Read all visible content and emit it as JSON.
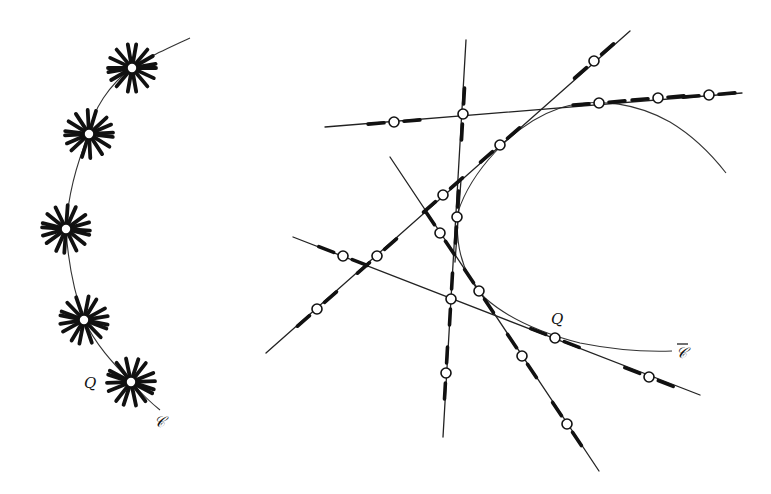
{
  "figure": {
    "left_panel": {
      "curve_label": "𝒞",
      "point_label": "Q",
      "curve_path": "M190,38 C160,52 142,60 132,68 C110,84 92,110 89,134 C78,160 68,195 66,229 C68,262 74,292 84,320 C96,345 112,362 131,382 C140,392 150,402 160,410",
      "stars": [
        {
          "cx": 132,
          "cy": 68
        },
        {
          "cx": 89,
          "cy": 134
        },
        {
          "cx": 66,
          "cy": 229
        },
        {
          "cx": 84,
          "cy": 320
        },
        {
          "cx": 131,
          "cy": 382
        }
      ],
      "label_positions": {
        "Q": {
          "x": 84,
          "y": 388
        },
        "C": {
          "x": 154,
          "y": 427
        }
      }
    },
    "right_panel": {
      "curve_label": "𝒞",
      "point_label": "Q",
      "curve_path_upper": "M458,212 C470,175 510,125 560,108 C600,96 640,105 670,122 C695,137 712,155 726,173",
      "curve_path_lower": "M458,212 C455,245 462,275 485,298 C510,320 545,334 580,343 C615,350 645,352 672,351",
      "lines": [
        {
          "id": "A",
          "x1": 466,
          "y1": 40,
          "x2": 443,
          "y2": 437
        },
        {
          "id": "B",
          "x1": 325,
          "y1": 127,
          "x2": 742,
          "y2": 93
        },
        {
          "id": "C",
          "x1": 266,
          "y1": 353,
          "x2": 630,
          "y2": 31
        },
        {
          "id": "D",
          "x1": 390,
          "y1": 157,
          "x2": 599,
          "y2": 471
        },
        {
          "id": "E",
          "x1": 293,
          "y1": 237,
          "x2": 700,
          "y2": 395
        },
        {
          "id": "F",
          "x1": 461,
          "y1": 180,
          "x2": 455,
          "y2": 262
        }
      ],
      "nodes": [
        {
          "cx": 463,
          "cy": 114
        },
        {
          "cx": 394,
          "cy": 122
        },
        {
          "cx": 599,
          "cy": 103
        },
        {
          "cx": 658,
          "cy": 98
        },
        {
          "cx": 709,
          "cy": 95
        },
        {
          "cx": 594,
          "cy": 61
        },
        {
          "cx": 500,
          "cy": 145
        },
        {
          "cx": 443,
          "cy": 195
        },
        {
          "cx": 377,
          "cy": 256
        },
        {
          "cx": 317,
          "cy": 309
        },
        {
          "cx": 457,
          "cy": 217
        },
        {
          "cx": 440,
          "cy": 233
        },
        {
          "cx": 479,
          "cy": 291
        },
        {
          "cx": 522,
          "cy": 356
        },
        {
          "cx": 567,
          "cy": 424
        },
        {
          "cx": 343,
          "cy": 256
        },
        {
          "cx": 451,
          "cy": 299
        },
        {
          "cx": 555,
          "cy": 338
        },
        {
          "cx": 649,
          "cy": 377
        },
        {
          "cx": 446,
          "cy": 373
        }
      ],
      "label_positions": {
        "Q": {
          "x": 551,
          "y": 324
        },
        "C": {
          "x": 676,
          "y": 358
        }
      }
    }
  }
}
